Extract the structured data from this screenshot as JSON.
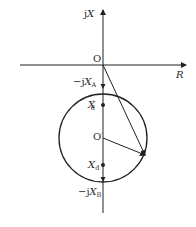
{
  "diagram": {
    "type": "impedance-circle-locus",
    "axes": {
      "horizontal": {
        "label": "R"
      },
      "vertical": {
        "label_prefix": "j",
        "label_var": "X"
      }
    },
    "origin": {
      "label": "O"
    },
    "circle_center": {
      "label": "O",
      "prime": "′"
    },
    "points": [
      {
        "id": "xa",
        "prefix": "−j",
        "var": "X",
        "sub": "A",
        "prime": ""
      },
      {
        "id": "xd_prime",
        "prefix": "",
        "var": "X",
        "sub": "d",
        "prime": "′"
      },
      {
        "id": "xd",
        "prefix": "",
        "var": "X",
        "sub": "d",
        "prime": ""
      },
      {
        "id": "xb",
        "prefix": "−j",
        "var": "X",
        "sub": "B",
        "prime": ""
      }
    ],
    "colors": {
      "line": "#222222",
      "text": "#2a2a2a",
      "background": "#ffffff"
    }
  }
}
